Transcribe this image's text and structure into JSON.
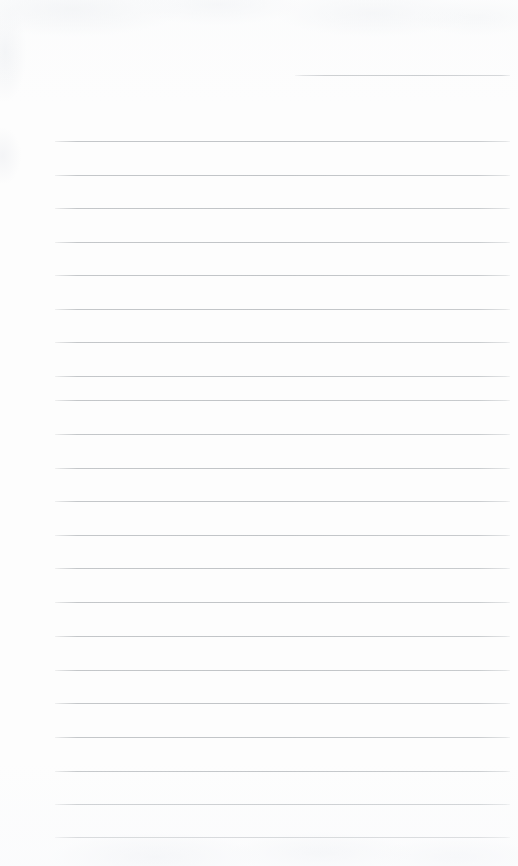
{
  "document": {
    "type": "scanned-ruled-notepad-page",
    "title": "Blank Ruled Notepad Page",
    "content_text": "",
    "handwriting_present": "no",
    "page_width": 518,
    "page_height": 866
  },
  "colors": {
    "paper_background": "#fdfdfd",
    "page_border": "#ffffff",
    "rule_line": "#c1c4c7",
    "rule_line_faded": "#d6d8db",
    "texture_mottle": "#eceef1"
  },
  "layout": {
    "rule_left_x": 55,
    "rule_right_x": 510,
    "rule_spacing": 33.5,
    "rule_thickness": 1,
    "partial_rule_left_x": 295,
    "partial_rule_right_x": 510,
    "first_full_rule_y": 141,
    "last_full_rule_y": 837,
    "full_rule_count": 21
  },
  "rules": {
    "partial": [
      {
        "name": "partial-rule-1",
        "y": 75,
        "left": 295,
        "right": 510
      }
    ],
    "full": [
      {
        "name": "rule-1",
        "y": 141
      },
      {
        "name": "rule-2",
        "y": 175
      },
      {
        "name": "rule-3",
        "y": 208
      },
      {
        "name": "rule-4",
        "y": 242
      },
      {
        "name": "rule-5",
        "y": 275
      },
      {
        "name": "rule-6",
        "y": 309
      },
      {
        "name": "rule-7",
        "y": 342
      },
      {
        "name": "rule-8",
        "y": 376
      },
      {
        "name": "rule-9",
        "y": 400
      },
      {
        "name": "rule-10",
        "y": 434
      },
      {
        "name": "rule-11",
        "y": 468
      },
      {
        "name": "rule-12",
        "y": 501
      },
      {
        "name": "rule-13",
        "y": 535
      },
      {
        "name": "rule-14",
        "y": 568
      },
      {
        "name": "rule-15",
        "y": 602
      },
      {
        "name": "rule-16",
        "y": 636
      },
      {
        "name": "rule-17",
        "y": 670
      },
      {
        "name": "rule-18",
        "y": 703
      },
      {
        "name": "rule-19",
        "y": 737
      },
      {
        "name": "rule-20",
        "y": 771
      },
      {
        "name": "rule-21",
        "y": 804
      },
      {
        "name": "rule-22",
        "y": 837
      }
    ]
  }
}
